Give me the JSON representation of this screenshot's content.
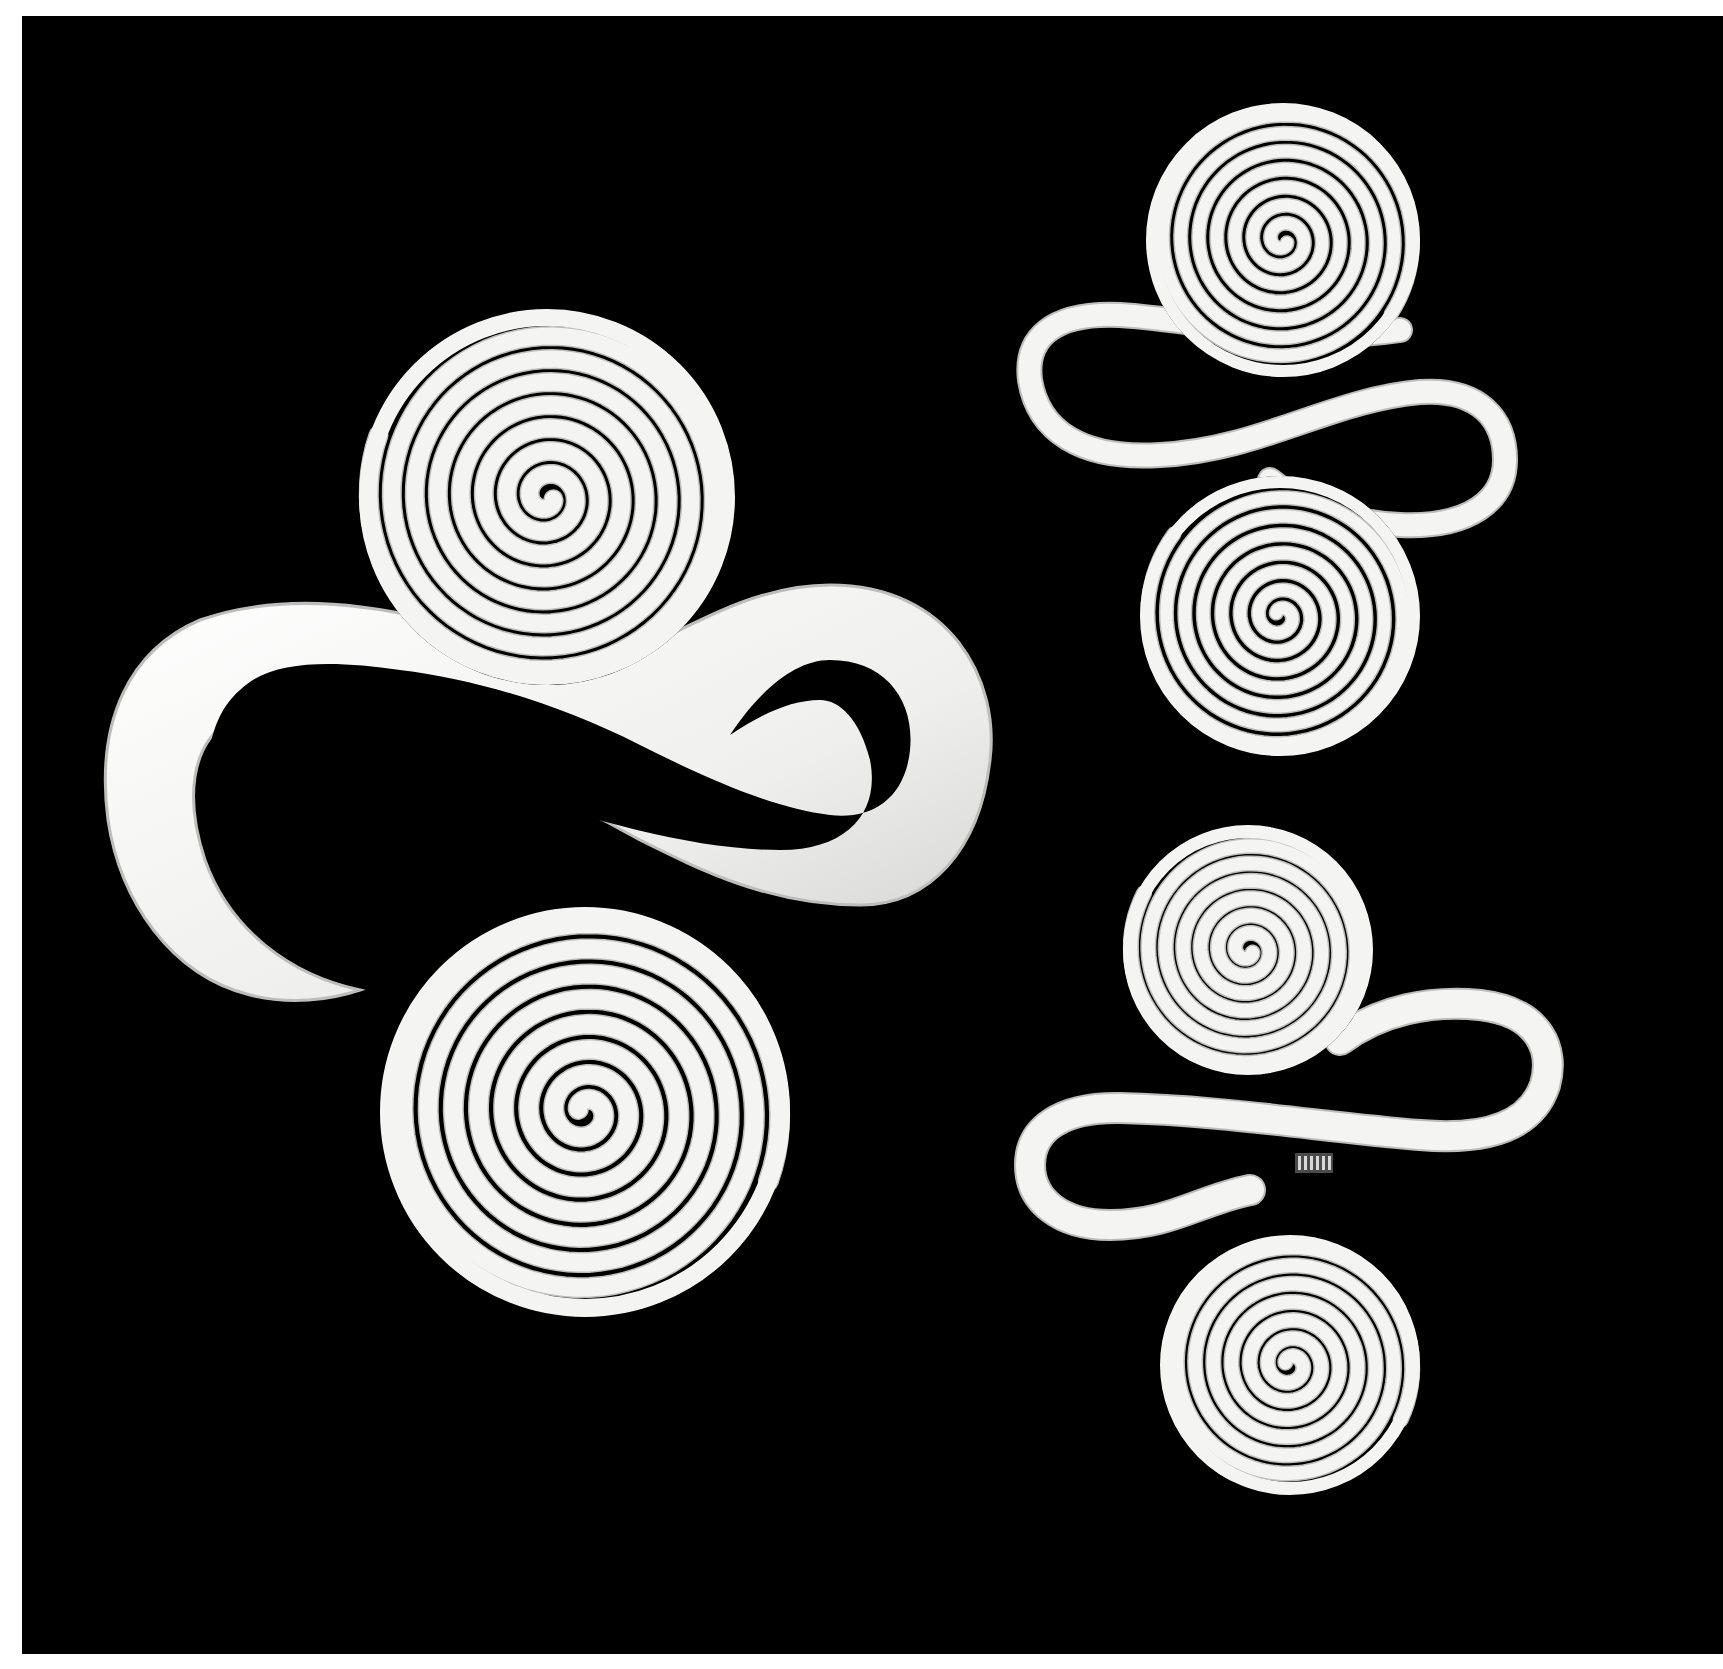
{
  "image": {
    "description": "Black-and-white photograph of three silver double-spiral ornaments on a black background",
    "background_color": "#000000",
    "margin_color": "#ffffff",
    "metal_color": "#f4f4f2",
    "metal_shadow_color": "#bdbdbb",
    "frame": {
      "x": 22,
      "y": 16,
      "width": 1701,
      "height": 1638
    }
  },
  "ornaments": [
    {
      "name": "large-double-spiral",
      "spirals": [
        {
          "cx": 547,
          "cy": 497,
          "r": 188,
          "turns": 7.5,
          "stroke": 17,
          "start_angle": 0.35
        },
        {
          "cx": 585,
          "cy": 1112,
          "r": 205,
          "turns": 7.5,
          "stroke": 18,
          "start_angle": 3.5
        }
      ],
      "band": {
        "outer_path": "M 640 650 C 700 620 760 585 830 585 C 950 585 1000 680 990 760 C 980 850 930 905 860 905 C 770 905 700 870 640 840 C 560 795 490 765 420 740 C 330 710 270 700 230 720 C 190 745 185 800 205 860 C 230 930 290 975 360 990 C 330 1000 290 1005 250 995 C 170 975 120 900 108 820 C 95 720 130 650 200 620 C 300 585 420 610 530 650 C 570 662 605 662 640 650 Z",
        "inner_path": "M 830 660 C 885 660 915 700 910 750 C 905 800 870 820 830 815 C 770 808 700 775 640 745 C 560 705 480 680 400 670 C 330 660 270 660 240 690 C 205 720 200 780 220 830 C 235 865 255 890 280 905 C 340 920 380 900 400 890 C 390 870 350 855 300 820 C 260 790 245 760 265 745 C 300 725 380 745 460 775 C 560 810 680 850 780 850 C 850 850 880 810 870 760 C 860 720 840 700 820 700 C 790 700 760 715 730 735 C 760 690 795 660 830 660 Z"
      }
    },
    {
      "name": "small-double-spiral-top",
      "spirals": [
        {
          "cx": 1283,
          "cy": 240,
          "r": 137,
          "turns": 7,
          "stroke": 12,
          "start_angle": 0.6
        },
        {
          "cx": 1280,
          "cy": 616,
          "r": 140,
          "turns": 7,
          "stroke": 12,
          "start_angle": 3.8
        }
      ],
      "band_path": "M 1400 330 C 1300 345 1200 320 1120 315 C 1050 312 1025 340 1030 380 C 1038 430 1080 460 1160 455 C 1260 450 1330 400 1420 392 C 1480 388 1505 420 1505 460 C 1505 500 1470 528 1400 525 C 1340 522 1300 505 1270 480",
      "band_stroke": 22
    },
    {
      "name": "small-double-spiral-bottom",
      "spirals": [
        {
          "cx": 1248,
          "cy": 950,
          "r": 125,
          "turns": 6.5,
          "stroke": 13,
          "start_angle": 0.5
        },
        {
          "cx": 1290,
          "cy": 1365,
          "r": 130,
          "turns": 6.5,
          "stroke": 13,
          "start_angle": 3.6
        }
      ],
      "band_path": "M 1340 1040 C 1380 1010 1430 1000 1480 1005 C 1540 1012 1555 1050 1545 1085 C 1530 1130 1480 1140 1420 1135 C 1330 1128 1220 1110 1120 1108 C 1060 1107 1030 1130 1030 1165 C 1030 1200 1060 1225 1110 1225 C 1170 1225 1200 1200 1250 1190",
      "band_stroke": 28,
      "hallmark": {
        "x": 1295,
        "y": 1153,
        "width": 38,
        "height": 20,
        "label": "silversmith-hallmark"
      }
    }
  ]
}
